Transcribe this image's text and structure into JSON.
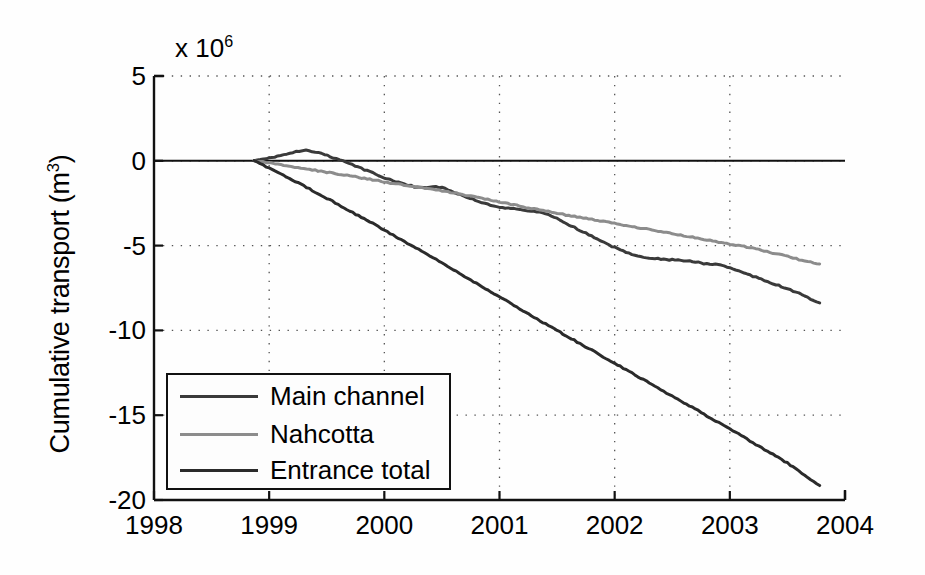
{
  "chart_data": {
    "type": "line",
    "title": "",
    "xlabel": "",
    "ylabel": "Cumulative transport (m3)",
    "ylabel_text": "Cumulative transport (m",
    "ylabel_sup": "3",
    "ylabel_tail": ")",
    "y_exponent_prefix": "x 10",
    "y_exponent_power": "6",
    "y_axis_multiplier": 1000000,
    "xlim": [
      1998,
      2004
    ],
    "ylim": [
      -20,
      5
    ],
    "xticks": [
      1998,
      1999,
      2000,
      2001,
      2002,
      2003,
      2004
    ],
    "xticklabels": [
      "1998",
      "1999",
      "2000",
      "2001",
      "2002",
      "2003",
      "2004"
    ],
    "yticks": [
      5,
      0,
      -5,
      -10,
      -15,
      -20
    ],
    "yticklabels": [
      "5",
      "0",
      "-5",
      "-10",
      "-15",
      "-20"
    ],
    "grid": "dotted",
    "grid_color": "#555555",
    "axis_color": "#111111",
    "background": "#fefefe",
    "zero_line": true,
    "legend_position": "lower left",
    "series": [
      {
        "name": "Main channel",
        "color": "#3a3a3a",
        "width": 3.0,
        "x": [
          1998.87,
          1998.95,
          1999.02,
          1999.1,
          1999.18,
          1999.26,
          1999.32,
          1999.4,
          1999.48,
          1999.56,
          1999.64,
          1999.72,
          1999.8,
          1999.9,
          2000.0,
          2000.1,
          2000.18,
          2000.26,
          2000.34,
          2000.42,
          2000.5,
          2000.58,
          2000.66,
          2000.74,
          2000.82,
          2000.9,
          2001.0,
          2001.1,
          2001.2,
          2001.3,
          2001.4,
          2001.5,
          2001.6,
          2001.7,
          2001.8,
          2001.9,
          2002.0,
          2002.1,
          2002.2,
          2002.3,
          2002.4,
          2002.5,
          2002.6,
          2002.7,
          2002.8,
          2002.9,
          2003.0,
          2003.1,
          2003.2,
          2003.3,
          2003.4,
          2003.5,
          2003.6,
          2003.7,
          2003.78
        ],
        "y": [
          0.0,
          0.08,
          0.18,
          0.3,
          0.46,
          0.58,
          0.6,
          0.52,
          0.36,
          0.18,
          0.0,
          -0.22,
          -0.45,
          -0.72,
          -1.0,
          -1.22,
          -1.4,
          -1.52,
          -1.58,
          -1.5,
          -1.58,
          -1.78,
          -2.0,
          -2.2,
          -2.4,
          -2.58,
          -2.72,
          -2.82,
          -2.9,
          -2.98,
          -3.12,
          -3.4,
          -3.75,
          -4.1,
          -4.45,
          -4.8,
          -5.1,
          -5.4,
          -5.6,
          -5.72,
          -5.8,
          -5.84,
          -5.88,
          -5.96,
          -6.08,
          -6.1,
          -6.3,
          -6.55,
          -6.8,
          -7.05,
          -7.3,
          -7.55,
          -7.82,
          -8.15,
          -8.38
        ]
      },
      {
        "name": "Nahcotta",
        "color": "#8c8c8c",
        "width": 3.0,
        "x": [
          1998.87,
          1999.0,
          1999.15,
          1999.3,
          1999.45,
          1999.6,
          1999.75,
          1999.9,
          2000.05,
          2000.2,
          2000.35,
          2000.5,
          2000.65,
          2000.8,
          2000.95,
          2001.1,
          2001.25,
          2001.4,
          2001.55,
          2001.7,
          2001.85,
          2002.0,
          2002.15,
          2002.3,
          2002.45,
          2002.6,
          2002.75,
          2002.9,
          2003.05,
          2003.2,
          2003.35,
          2003.5,
          2003.65,
          2003.78
        ],
        "y": [
          0.0,
          -0.12,
          -0.28,
          -0.45,
          -0.62,
          -0.78,
          -0.95,
          -1.12,
          -1.3,
          -1.48,
          -1.62,
          -1.76,
          -1.95,
          -2.15,
          -2.35,
          -2.56,
          -2.76,
          -2.96,
          -3.16,
          -3.34,
          -3.52,
          -3.7,
          -3.88,
          -4.06,
          -4.24,
          -4.42,
          -4.6,
          -4.78,
          -4.96,
          -5.16,
          -5.4,
          -5.64,
          -5.9,
          -6.08
        ]
      },
      {
        "name": "Entrance total",
        "color": "#2b2b2b",
        "width": 3.0,
        "x": [
          1998.87,
          1999.0,
          1999.15,
          1999.3,
          1999.45,
          1999.6,
          1999.75,
          1999.9,
          2000.05,
          2000.2,
          2000.35,
          2000.5,
          2000.65,
          2000.8,
          2000.95,
          2001.1,
          2001.25,
          2001.4,
          2001.55,
          2001.7,
          2001.85,
          2002.0,
          2002.15,
          2002.3,
          2002.45,
          2002.6,
          2002.75,
          2002.9,
          2003.05,
          2003.2,
          2003.35,
          2003.5,
          2003.65,
          2003.78
        ],
        "y": [
          0.0,
          -0.42,
          -0.95,
          -1.48,
          -2.02,
          -2.58,
          -3.14,
          -3.7,
          -4.28,
          -4.86,
          -5.44,
          -6.02,
          -6.62,
          -7.22,
          -7.82,
          -8.42,
          -9.02,
          -9.62,
          -10.2,
          -10.78,
          -11.36,
          -11.94,
          -12.52,
          -13.1,
          -13.68,
          -14.26,
          -14.84,
          -15.42,
          -16.0,
          -16.62,
          -17.22,
          -17.82,
          -18.55,
          -19.15
        ]
      }
    ]
  },
  "legend": {
    "entries": [
      {
        "label": "Main channel"
      },
      {
        "label": "Nahcotta"
      },
      {
        "label": "Entrance total"
      }
    ]
  }
}
